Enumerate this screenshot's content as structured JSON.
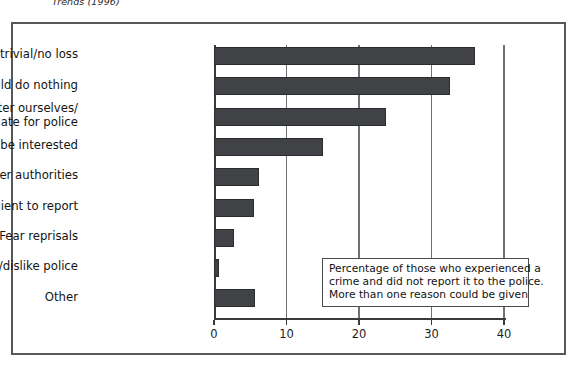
{
  "caption": {
    "text": "Trends (1996)"
  },
  "chart_data": {
    "type": "bar",
    "orientation": "horizontal",
    "title": "",
    "subtitle": "",
    "xlabel": "",
    "ylabel": "",
    "xlim": [
      0,
      40
    ],
    "xticks": [
      0,
      10,
      20,
      30,
      40
    ],
    "xtick_labels": [
      "0",
      "10",
      "20",
      "30",
      "40"
    ],
    "grid": true,
    "grid_axis": "x",
    "legend": false,
    "bar_color": "#404245",
    "categories": [
      "Too trivial/no loss",
      "Police could do nothing",
      "We dealt with matter ourselves/\ninappropriate for police",
      "Police would not be interested",
      "Reported to other authorities",
      "Inconvenient to report",
      "Fear reprisals",
      "Fear/dislike police",
      "Other"
    ],
    "values": [
      36,
      32.5,
      23.7,
      15,
      6.2,
      5.5,
      2.8,
      0.7,
      5.6
    ],
    "annotations": [
      "Percentage of those who experienced a",
      "crime and did not report it to the police.",
      "More than one reason could be given"
    ]
  }
}
